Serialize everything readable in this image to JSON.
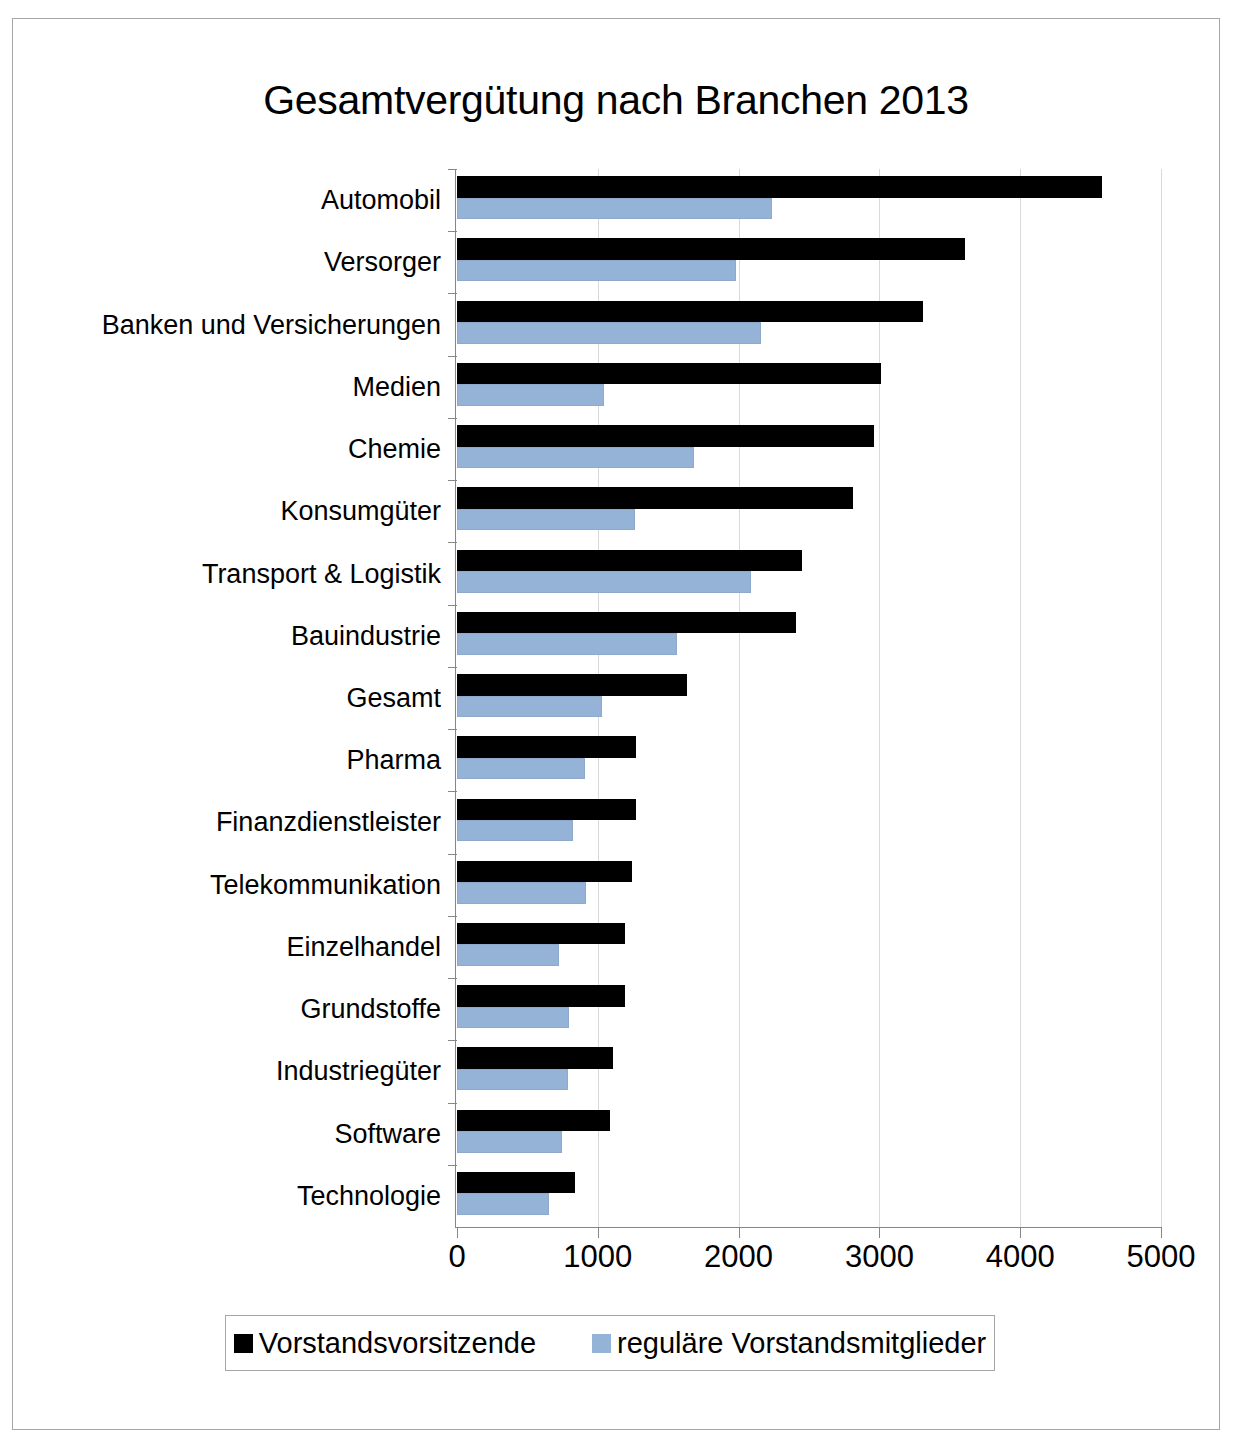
{
  "chart_data": {
    "type": "bar",
    "orientation": "horizontal",
    "title": "Gesamtvergütung nach Branchen 2013",
    "xlabel": "",
    "ylabel": "",
    "xlim": [
      0,
      5000
    ],
    "xticks": [
      0,
      1000,
      2000,
      3000,
      4000,
      5000
    ],
    "xtick_labels": [
      "0",
      "1000",
      "2000",
      "3000",
      "4000",
      "5000"
    ],
    "grid": "vertical",
    "legend_position": "bottom",
    "categories": [
      "Automobil",
      "Versorger",
      "Banken und Versicherungen",
      "Medien",
      "Chemie",
      "Konsumgüter",
      "Transport & Logistik",
      "Bauindustrie",
      "Gesamt",
      "Pharma",
      "Finanzdienstleister",
      "Telekommunikation",
      "Einzelhandel",
      "Grundstoffe",
      "Industriegüter",
      "Software",
      "Technologie"
    ],
    "series": [
      {
        "name": "Vorstandsvorsitzende",
        "color": "#000000",
        "values": [
          4580,
          3610,
          3310,
          3010,
          2960,
          2810,
          2450,
          2410,
          1630,
          1270,
          1270,
          1240,
          1190,
          1190,
          1110,
          1090,
          840
        ]
      },
      {
        "name": "reguläre Vorstandsmitglieder",
        "color": "#95b3d7",
        "values": [
          2240,
          1980,
          2160,
          1045,
          1680,
          1265,
          2090,
          1560,
          1030,
          910,
          825,
          915,
          725,
          795,
          790,
          745,
          655
        ]
      }
    ]
  },
  "legend": {
    "items": [
      {
        "label": "Vorstandsvorsitzende",
        "color": "#000000"
      },
      {
        "label": "reguläre Vorstandsmitglieder",
        "color": "#95b3d7"
      }
    ]
  }
}
